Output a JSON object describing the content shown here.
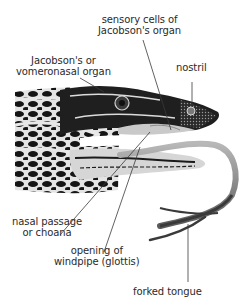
{
  "diagram": {
    "labels": [
      {
        "id": "sensory-cells",
        "lines": [
          "sensory cells of",
          "Jacobson's organ"
        ]
      },
      {
        "id": "jacobsons-organ",
        "lines": [
          "Jacobson's or",
          "vomeronasal organ"
        ]
      },
      {
        "id": "nostril",
        "lines": [
          "nostril"
        ]
      },
      {
        "id": "nasal-passage",
        "lines": [
          "nasal passage",
          "or choana"
        ]
      },
      {
        "id": "glottis",
        "lines": [
          "opening of",
          "windpipe (glottis)"
        ]
      },
      {
        "id": "forked-tongue",
        "lines": [
          "forked tongue"
        ]
      }
    ],
    "colors": {
      "text": "#2a2a2a",
      "leader_line": "#3a3a3a",
      "skin_dark": "#1c1c1c",
      "skin_light": "#e6e6e6",
      "mouth": "#c9c9c9",
      "tongue": "#8a8a8a"
    }
  }
}
